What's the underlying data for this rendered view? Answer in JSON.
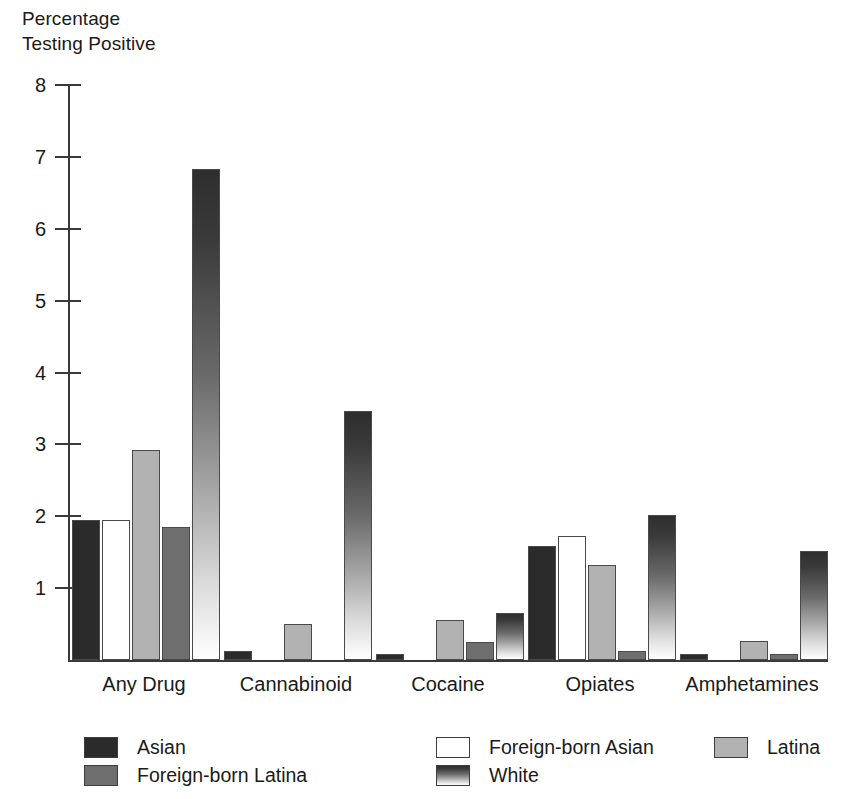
{
  "chart_data": {
    "type": "bar",
    "title": "",
    "subtitle": "",
    "ylabel": "Percentage\nTesting Positive",
    "xlabel": "",
    "ylim": [
      0,
      8
    ],
    "yticks": [
      0,
      1,
      2,
      3,
      4,
      5,
      6,
      7,
      8
    ],
    "ytick_labels": [
      "",
      "1",
      "2",
      "3",
      "4",
      "5",
      "6",
      "7",
      "8"
    ],
    "grid": false,
    "legend_position": "bottom",
    "categories": [
      "Any Drug",
      "Cannabinoid",
      "Cocaine",
      "Opiates",
      "Amphetamines"
    ],
    "series": [
      {
        "name": "Asian",
        "color": "#2b2b2b",
        "values": [
          1.95,
          0.13,
          0.08,
          1.58,
          0.08
        ]
      },
      {
        "name": "Foreign-born Asian",
        "color": "#ffffff",
        "values": [
          1.95,
          0.0,
          0.0,
          1.72,
          0.0
        ]
      },
      {
        "name": "Latina",
        "color": "#b2b2b2",
        "values": [
          2.92,
          0.5,
          0.55,
          1.32,
          0.27
        ]
      },
      {
        "name": "Foreign-born Latina",
        "color": "#6e6e6e",
        "values": [
          1.85,
          0.0,
          0.25,
          0.12,
          0.08
        ]
      },
      {
        "name": "White",
        "color": "#555555",
        "values": [
          6.83,
          3.47,
          0.66,
          2.02,
          1.51
        ]
      }
    ]
  },
  "axis": {
    "y_title_line1": "Percentage",
    "y_title_line2": "Testing Positive"
  },
  "legend": {
    "items": [
      {
        "label": "Asian",
        "swatch": "dark-swatch"
      },
      {
        "label": "Foreign-born Asian",
        "swatch": "white-swatch"
      },
      {
        "label": "Latina",
        "swatch": "light-gray-swatch"
      },
      {
        "label": "Foreign-born Latina",
        "swatch": "medium-gray-swatch"
      },
      {
        "label": "White",
        "swatch": "gradient-swatch"
      }
    ]
  }
}
